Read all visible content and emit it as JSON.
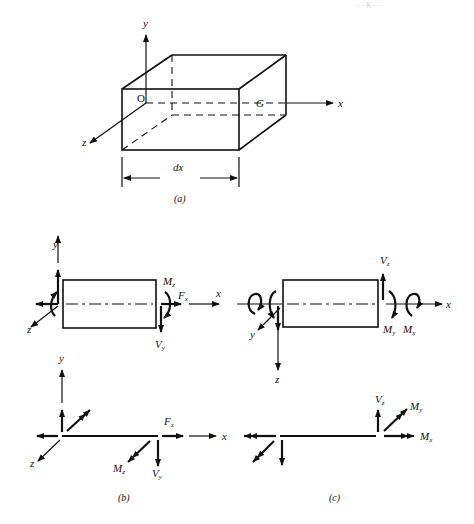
{
  "header_fragment": "… g …",
  "figure_a": {
    "caption": "(a)",
    "axes": {
      "x": "x",
      "y": "y",
      "z": "z"
    },
    "origin_label": "O",
    "centroid_label": "G",
    "dimension_label": "dx"
  },
  "figure_b": {
    "caption": "(b)",
    "axes": {
      "x": "x",
      "y": "y",
      "z": "z"
    },
    "labels": {
      "moment_z": "M",
      "moment_z_sub": "z",
      "axial_force": "F",
      "axial_force_sub": "x",
      "shear_y": "V",
      "shear_y_sub": "y"
    }
  },
  "figure_c": {
    "caption": "(c)",
    "axes": {
      "x": "x",
      "y": "y",
      "z": "z"
    },
    "labels": {
      "shear_z": "V",
      "shear_z_sub": "z",
      "moment_y": "M",
      "moment_y_sub": "y",
      "torsion_x": "M",
      "torsion_x_sub": "x"
    }
  },
  "colors": {
    "ink": "#111111",
    "background": "#ffffff"
  }
}
